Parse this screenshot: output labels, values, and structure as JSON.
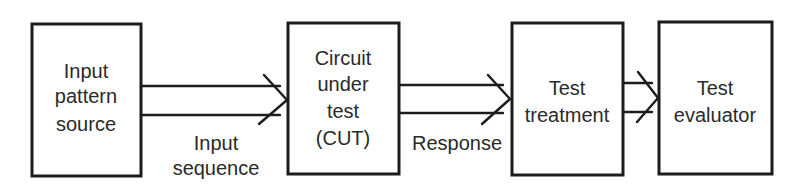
{
  "diagram": {
    "blocks": [
      {
        "id": "source",
        "lines": [
          "Input",
          "pattern",
          "source"
        ]
      },
      {
        "id": "cut",
        "lines": [
          "Circuit",
          "under",
          "test",
          "(CUT)"
        ]
      },
      {
        "id": "treatment",
        "lines": [
          "Test",
          "treatment"
        ]
      },
      {
        "id": "evaluator",
        "lines": [
          "Test",
          "evaluator"
        ]
      }
    ],
    "connections": [
      {
        "from": "source",
        "to": "cut",
        "label_lines": [
          "Input",
          "sequence"
        ]
      },
      {
        "from": "cut",
        "to": "treatment",
        "label_lines": [
          "Response"
        ]
      },
      {
        "from": "treatment",
        "to": "evaluator",
        "label_lines": []
      }
    ],
    "colors": {
      "stroke": "#1c1c1c",
      "text": "#2a2a2a",
      "background": "#ffffff"
    }
  }
}
